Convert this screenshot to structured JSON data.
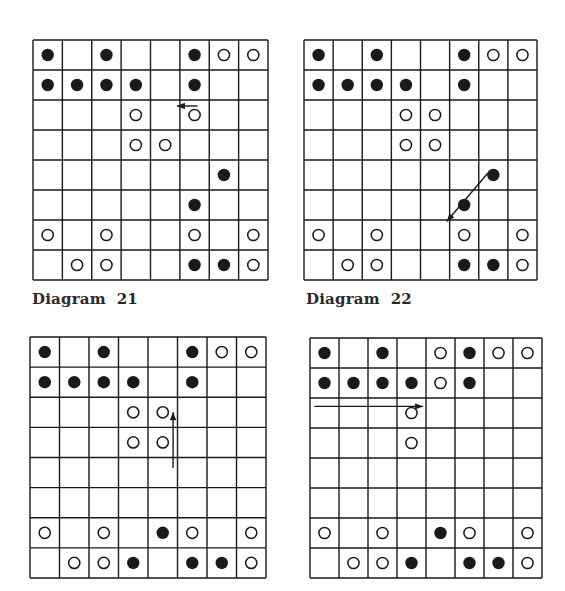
{
  "colors": {
    "ink": "#1a1a1a",
    "paper": "#ffffff"
  },
  "legend": {
    "B": "black piece (filled circle)",
    "W": "white piece (open circle)",
    ".": "empty square"
  },
  "diagrams": [
    {
      "id": "21",
      "caption": "Diagram  21",
      "rows": [
        "B.B..BWW",
        "BBBB.B..",
        "...W.W..",
        "...WW...",
        "......B.",
        ".....B..",
        "W.W..W.W",
        ".WW..BBW"
      ],
      "arrow": {
        "from": [
          2,
          5.6
        ],
        "to": [
          2,
          4.9
        ],
        "row_offset": -0.3,
        "description": "short leftward arrow above white piece in row 3, column 6"
      }
    },
    {
      "id": "22",
      "caption": "Diagram  22",
      "rows": [
        "B.B..BWW",
        "BBBB.B..",
        "...WW...",
        "...WW...",
        "......B.",
        ".....B..",
        "W.W..W.W",
        ".WW..BBW"
      ],
      "arrow": {
        "from": [
          3.95,
          6.3
        ],
        "to": [
          5.55,
          4.9
        ],
        "row_offset": 0,
        "description": "diagonal arrow from black piece row 5 col 7 down-left to row 6 col 6"
      }
    },
    {
      "id": "23",
      "caption": "",
      "rows": [
        "B.B..BWW",
        "BBBB.B..",
        "...WW...",
        "...WW...",
        "........",
        "........",
        "W.W.BW.W",
        ".WWB.BBW"
      ],
      "arrow": {
        "from": [
          3.85,
          4.85
        ],
        "to": [
          2.0,
          4.85
        ],
        "row_offset": 0,
        "description": "vertical upward arrow along column 5 from row 4 to row 3"
      }
    },
    {
      "id": "24",
      "caption": "",
      "rows": [
        "B.B.WBWW",
        "BBBBWB..",
        "...W....",
        "...W....",
        "........",
        "........",
        "W.W.BW.W",
        ".WWB.BBW"
      ],
      "arrow": {
        "from": [
          1.78,
          0.15
        ],
        "to": [
          1.78,
          3.9
        ],
        "row_offset": 0,
        "description": "horizontal rightward arrow under black pieces in row 2, columns 1 to 4"
      }
    }
  ]
}
